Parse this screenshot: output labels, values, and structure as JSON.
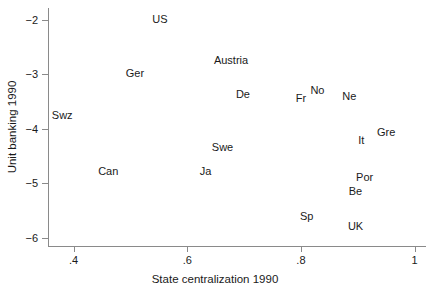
{
  "chart_data": {
    "type": "scatter",
    "title": "",
    "xlabel": "State centralization 1990",
    "ylabel": "Unit banking 1990",
    "xlim": [
      0.355,
      1.02
    ],
    "ylim": [
      -6.15,
      -1.78
    ],
    "xticks": [
      ".4",
      ".6",
      ".8",
      "1"
    ],
    "xtick_values": [
      0.4,
      0.6,
      0.8,
      1.0
    ],
    "yticks": [
      "−2",
      "−3",
      "−4",
      "−5",
      "−6"
    ],
    "ytick_values": [
      -2,
      -3,
      -4,
      -5,
      -6
    ],
    "grid": false,
    "legend": "none",
    "marker": "text-label-only",
    "points": [
      {
        "label": "US",
        "x": 0.552,
        "y": -1.98
      },
      {
        "label": "Austria",
        "x": 0.677,
        "y": -2.73
      },
      {
        "label": "Ger",
        "x": 0.508,
        "y": -2.98
      },
      {
        "label": "De",
        "x": 0.698,
        "y": -3.35
      },
      {
        "label": "No",
        "x": 0.829,
        "y": -3.28
      },
      {
        "label": "Fr",
        "x": 0.8,
        "y": -3.43
      },
      {
        "label": "Ne",
        "x": 0.885,
        "y": -3.39
      },
      {
        "label": "Swz",
        "x": 0.38,
        "y": -3.74
      },
      {
        "label": "Gre",
        "x": 0.95,
        "y": -4.06
      },
      {
        "label": "It",
        "x": 0.906,
        "y": -4.21
      },
      {
        "label": "Swe",
        "x": 0.662,
        "y": -4.33
      },
      {
        "label": "Can",
        "x": 0.461,
        "y": -4.77
      },
      {
        "label": "Ja",
        "x": 0.632,
        "y": -4.77
      },
      {
        "label": "Por",
        "x": 0.912,
        "y": -4.89
      },
      {
        "label": "Be",
        "x": 0.896,
        "y": -5.14
      },
      {
        "label": "Sp",
        "x": 0.81,
        "y": -5.6
      },
      {
        "label": "UK",
        "x": 0.896,
        "y": -5.78
      }
    ]
  }
}
